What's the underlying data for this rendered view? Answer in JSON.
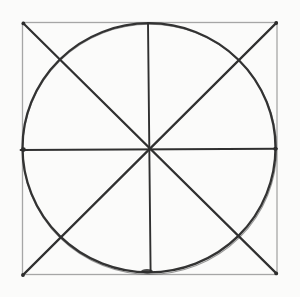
{
  "canvas": {
    "width": 300,
    "height": 297,
    "background": "#fbfbfa"
  },
  "drawing": {
    "description": "Hand-drawn geometric construction: a square with an inscribed circle, both diagonals, and vertical and horizontal center axes all intersecting at the center point",
    "ink_color": "#303030",
    "pencil_edge_color": "#a6a6a6",
    "center_point": {
      "x": 149,
      "y": 149
    },
    "shapes": [
      {
        "name": "square-outline",
        "type": "rect",
        "attrs": {
          "x": 22.5,
          "y": 22.5,
          "width": 254.5,
          "height": 252,
          "fill": "none",
          "stroke": "#a6a6a6",
          "stroke-width": 1.3
        }
      },
      {
        "name": "inscribed-circle",
        "type": "ellipse",
        "attrs": {
          "cx": 149,
          "cy": 147.8,
          "rx": 126.5,
          "ry": 124.6,
          "fill": "none",
          "stroke": "#333333",
          "stroke-width": 2.3
        }
      },
      {
        "name": "inscribed-circle-overdraw",
        "type": "ellipse",
        "attrs": {
          "cx": 149.6,
          "cy": 149.2,
          "rx": 127,
          "ry": 125,
          "fill": "none",
          "stroke": "#333333",
          "stroke-width": 1.1,
          "opacity": 0.5
        }
      },
      {
        "name": "diagonal-topleft-bottomright",
        "type": "line",
        "attrs": {
          "x1": 23,
          "y1": 23,
          "x2": 276.6,
          "y2": 273.6,
          "stroke": "#303030",
          "stroke-width": 2.2,
          "stroke-linecap": "round"
        }
      },
      {
        "name": "diagonal-topright-bottomleft",
        "type": "line",
        "attrs": {
          "x1": 276.6,
          "y1": 22.6,
          "x2": 22.6,
          "y2": 275.4,
          "stroke": "#303030",
          "stroke-width": 2.2,
          "stroke-linecap": "round"
        }
      },
      {
        "name": "vertical-center-axis",
        "type": "line",
        "attrs": {
          "x1": 148,
          "y1": 23,
          "x2": 150.6,
          "y2": 271.8,
          "stroke": "#303030",
          "stroke-width": 1.9,
          "stroke-linecap": "round"
        }
      },
      {
        "name": "horizontal-center-axis",
        "type": "line",
        "attrs": {
          "x1": 20.6,
          "y1": 150,
          "x2": 276.8,
          "y2": 148.8,
          "stroke": "#303030",
          "stroke-width": 2,
          "stroke-linecap": "round"
        }
      },
      {
        "name": "tangent-mark-left",
        "type": "circle",
        "attrs": {
          "cx": 23.4,
          "cy": 149.6,
          "r": 2.4,
          "fill": "#2c2c2c"
        }
      },
      {
        "name": "tangent-mark-right",
        "type": "circle",
        "attrs": {
          "cx": 275.4,
          "cy": 148.8,
          "r": 2.1,
          "fill": "#2c2c2c"
        }
      },
      {
        "name": "tangent-mark-bottom",
        "type": "ellipse",
        "attrs": {
          "cx": 147,
          "cy": 271.2,
          "rx": 6,
          "ry": 2.2,
          "fill": "#2c2c2c",
          "opacity": 0.85
        }
      },
      {
        "name": "corner-mark-top-left",
        "type": "circle",
        "attrs": {
          "cx": 23.4,
          "cy": 23.4,
          "r": 1.9,
          "fill": "#2c2c2c"
        }
      },
      {
        "name": "corner-mark-top-right",
        "type": "circle",
        "attrs": {
          "cx": 276.2,
          "cy": 23,
          "r": 1.9,
          "fill": "#2c2c2c"
        }
      },
      {
        "name": "corner-mark-bottom-left",
        "type": "circle",
        "attrs": {
          "cx": 23,
          "cy": 275,
          "r": 1.9,
          "fill": "#2c2c2c"
        }
      },
      {
        "name": "corner-mark-bottom-right",
        "type": "circle",
        "attrs": {
          "cx": 276.2,
          "cy": 273.4,
          "r": 1.9,
          "fill": "#2c2c2c"
        }
      }
    ]
  }
}
